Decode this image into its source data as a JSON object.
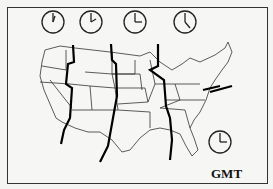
{
  "diagram": {
    "clocks": [
      {
        "zone": "Pacific",
        "hour_angle": 15,
        "minute_angle": 0
      },
      {
        "zone": "Mountain",
        "hour_angle": 45,
        "minute_angle": 0
      },
      {
        "zone": "Central",
        "hour_angle": 90,
        "minute_angle": 0
      },
      {
        "zone": "Eastern",
        "hour_angle": 135,
        "minute_angle": 0
      },
      {
        "zone": "GMT",
        "hour_angle": 90,
        "minute_angle": 0
      }
    ],
    "label": "GMT",
    "colors": {
      "line": "#111111",
      "background": "#f6f6f4"
    }
  }
}
